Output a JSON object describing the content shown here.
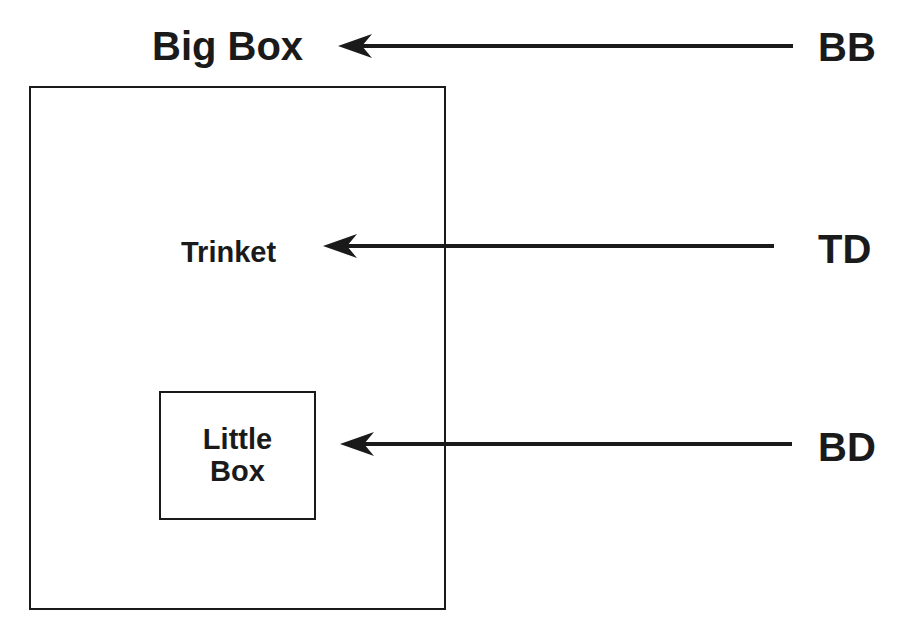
{
  "diagram": {
    "big_box": {
      "label": "Big Box"
    },
    "trinket": {
      "label": "Trinket"
    },
    "little_box": {
      "line1": "Little",
      "line2": "Box"
    },
    "pointers": [
      {
        "code": "BB",
        "target": "Big Box"
      },
      {
        "code": "TD",
        "target": "Trinket"
      },
      {
        "code": "BD",
        "target": "Little Box"
      }
    ],
    "colors": {
      "stroke": "#1a1a1a",
      "background": "#ffffff"
    }
  }
}
